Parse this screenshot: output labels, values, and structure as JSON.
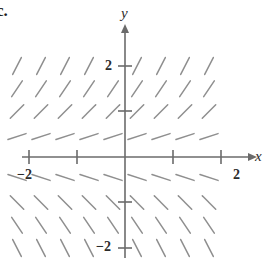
{
  "figure": {
    "part_label": "c.",
    "axis_labels": {
      "x": "x",
      "y": "y"
    },
    "tick_labels": {
      "x_negative_two": "−2",
      "x_positive_two": "2",
      "y_positive_two": "2",
      "y_negative_two": "−2"
    },
    "colors": {
      "axis": "#6b6b6b",
      "slope_mark": "#8f8f8f",
      "text": "#2b2b2b",
      "background": "#ffffff"
    }
  },
  "chart_data": {
    "type": "scatter",
    "title": "",
    "subtitle": "",
    "xlabel": "x",
    "ylabel": "y",
    "xlim": [
      -2.6,
      2.6
    ],
    "ylim": [
      -2.6,
      2.6
    ],
    "grid": false,
    "legend": null,
    "plot_kind": "slope-field",
    "equation": "dy/dx = y",
    "xticks": [
      -2,
      -1,
      0,
      1,
      2
    ],
    "yticks": [
      -2,
      -1,
      0,
      1,
      2
    ],
    "xtick_labels": [
      "−2",
      "",
      "",
      "",
      "2"
    ],
    "ytick_labels": [
      "−2",
      "",
      "",
      "",
      "2"
    ],
    "geometry": {
      "origin_px": [
        125,
        157
      ],
      "x_unit_px": 48,
      "y_unit_px": 45.5,
      "segment_length_px": 19
    },
    "sample_x": [
      -2.25,
      -1.75,
      -1.25,
      -0.75,
      -0.25,
      0.25,
      0.75,
      1.25,
      1.75
    ],
    "sample_y": [
      2.0,
      1.5,
      1.0,
      0.45,
      -0.45,
      -1.0,
      -1.5,
      -2.0
    ],
    "segments": [
      {
        "y": 2.0,
        "slope": 2.0,
        "angle_deg": 63
      },
      {
        "y": 1.5,
        "slope": 1.5,
        "angle_deg": 56
      },
      {
        "y": 1.0,
        "slope": 1.0,
        "angle_deg": 45
      },
      {
        "y": 0.45,
        "slope": 0.45,
        "angle_deg": 18
      },
      {
        "y": -0.45,
        "slope": -0.45,
        "angle_deg": -18
      },
      {
        "y": -1.0,
        "slope": -1.0,
        "angle_deg": -45
      },
      {
        "y": -1.5,
        "slope": -1.5,
        "angle_deg": -56
      },
      {
        "y": -2.0,
        "slope": -2.0,
        "angle_deg": -63
      }
    ],
    "omitted_marks": [
      {
        "x": -0.25,
        "y": 2.0,
        "reason": "covered by y-axis tick label 2"
      },
      {
        "x": -0.25,
        "y": -2.0,
        "reason": "covered by y-axis tick label -2"
      }
    ]
  }
}
